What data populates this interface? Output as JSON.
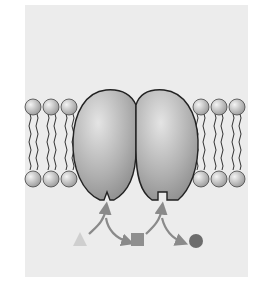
{
  "diagram": {
    "type": "membrane-bound multienzyme pathway",
    "colors": {
      "background": "#ffffff",
      "panel": "#ececec",
      "lipid_head": "#d4d4d4",
      "lipid_tail": "#333333",
      "enzyme": "#b4b4b4",
      "enzyme_outline": "#222222",
      "arrow": "#8a8a8a",
      "substrate_triangle": "#cfcfcf",
      "intermediate_square": "#8f8f8f",
      "product_circle": "#6c6c6c"
    },
    "membrane": {
      "left_lipid_count": 3,
      "right_lipid_count": 3
    },
    "enzymes": [
      {
        "name": "enzyme-1",
        "active_site": "v-notch"
      },
      {
        "name": "enzyme-2",
        "active_site": "square-notch"
      }
    ],
    "molecules": [
      {
        "name": "substrate",
        "shape": "triangle"
      },
      {
        "name": "intermediate",
        "shape": "square"
      },
      {
        "name": "product",
        "shape": "circle"
      }
    ]
  }
}
